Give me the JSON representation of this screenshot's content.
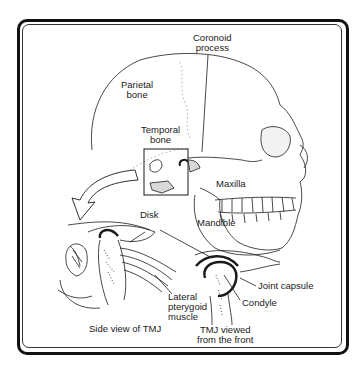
{
  "figure": {
    "labels": {
      "coronoid_process": [
        "Coronoid",
        "process"
      ],
      "parietal_bone": [
        "Parietal",
        "bone"
      ],
      "temporal_bone": [
        "Temporal",
        "bone"
      ],
      "maxilla": "Maxilla",
      "mandible": "Mandible",
      "disk": "Disk",
      "joint_capsule": "Joint capsule",
      "condyle": "Condyle",
      "lateral_pterygoid_muscle": [
        "Lateral",
        "pterygoid",
        "muscle"
      ]
    },
    "captions": {
      "side_view": "Side view of TMJ",
      "front_view": [
        "TMJ viewed",
        "from the front"
      ]
    },
    "colors": {
      "line": "#1a1a1a",
      "fill": "#ffffff",
      "shade": "#d8d8d8"
    }
  }
}
